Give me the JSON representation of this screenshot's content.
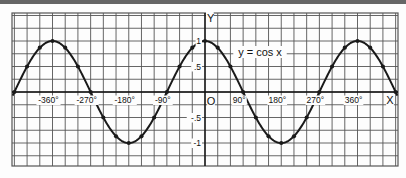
{
  "chart_data": {
    "type": "line",
    "title": "y = cos x",
    "xlabel": "X",
    "ylabel": "Y",
    "origin_label": "O",
    "x_tick_labels": [
      "-360°",
      "-270°",
      "-180°",
      "-90°",
      "90°",
      "180°",
      "270°",
      "360°"
    ],
    "x_ticks": [
      -360,
      -270,
      -180,
      -90,
      90,
      180,
      270,
      360
    ],
    "y_tick_labels": [
      "1",
      ".5",
      "-.5",
      "-1"
    ],
    "y_ticks": [
      1,
      0.5,
      -0.5,
      -1
    ],
    "xlim": [
      -450,
      450
    ],
    "ylim": [
      -1.25,
      1.25
    ],
    "grid": true,
    "series": [
      {
        "name": "y = cos x",
        "x": [
          -450,
          -420,
          -390,
          -360,
          -330,
          -300,
          -270,
          -240,
          -210,
          -180,
          -150,
          -120,
          -90,
          -60,
          -30,
          0,
          30,
          60,
          90,
          120,
          150,
          180,
          210,
          240,
          270,
          300,
          330,
          360,
          390,
          420,
          450
        ],
        "values": [
          0,
          0.5,
          0.87,
          1,
          0.87,
          0.5,
          0,
          -0.5,
          -0.87,
          -1,
          -0.87,
          -0.5,
          0,
          0.5,
          0.87,
          1,
          0.87,
          0.5,
          0,
          -0.5,
          -0.87,
          -1,
          -0.87,
          -0.5,
          0,
          0.5,
          0.87,
          1,
          0.87,
          0.5,
          0
        ]
      }
    ],
    "colors": {
      "line": "#1a1a1a",
      "grid": "#555555",
      "background": "#fdfdfd"
    }
  }
}
